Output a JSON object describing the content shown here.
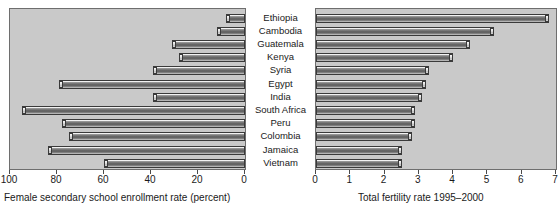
{
  "chart_data": {
    "type": "bar",
    "title": "",
    "layout": "bidirectional paired horizontal bar chart (population pyramid style)",
    "categories": [
      "Ethiopia",
      "Cambodia",
      "Guatemala",
      "Kenya",
      "Syria",
      "Egypt",
      "India",
      "South Africa",
      "Peru",
      "Colombia",
      "Jamaica",
      "Vietnam"
    ],
    "series": [
      {
        "name": "Female secondary school enrollment rate (percent)",
        "panel": "left",
        "direction": "right-to-left",
        "axis_label": "Female secondary school enrollment rate (percent)",
        "ticks": [
          100,
          80,
          60,
          40,
          20,
          0
        ],
        "xlim": [
          100,
          0
        ],
        "values": [
          8,
          12,
          31,
          28,
          39,
          79,
          39,
          95,
          78,
          75,
          84,
          60
        ]
      },
      {
        "name": "Total fertility rate 1995-2000",
        "panel": "right",
        "direction": "left-to-right",
        "axis_label": "Total fertility rate 1995–2000",
        "ticks": [
          0,
          1,
          2,
          3,
          4,
          5,
          6,
          7
        ],
        "xlim": [
          0,
          7
        ],
        "values": [
          6.8,
          5.2,
          4.5,
          4.0,
          3.3,
          3.2,
          3.1,
          2.9,
          2.9,
          2.8,
          2.5,
          2.5
        ]
      }
    ],
    "grid": false,
    "legend": "none"
  },
  "left_panel": {
    "axis_title": "Female secondary school enrollment rate (percent)",
    "tick_labels": [
      "100",
      "80",
      "60",
      "40",
      "20",
      "0"
    ]
  },
  "right_panel": {
    "axis_title": "Total fertility rate 1995–2000",
    "tick_labels": [
      "0",
      "1",
      "2",
      "3",
      "4",
      "5",
      "6",
      "7"
    ]
  },
  "colors": {
    "panel_background": "#c9c9c9",
    "page_background": "#ffffff",
    "bar_outline": "#3a3a3a",
    "text": "#1a1a1a"
  }
}
